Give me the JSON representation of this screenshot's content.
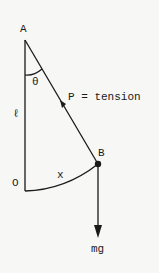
{
  "diagram": {
    "labels": {
      "pivot": "A",
      "origin": "O",
      "bob": "B",
      "angle": "θ",
      "length": "ℓ",
      "arc": "x",
      "tension": "P = tension",
      "weight": "mg"
    },
    "colors": {
      "background": "#f7f7f5",
      "ink": "#1a1a1a"
    }
  }
}
